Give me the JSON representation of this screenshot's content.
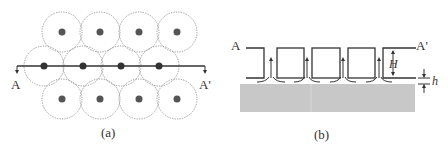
{
  "panel_a": {
    "caption": "(a)",
    "label_left": "A",
    "label_right": "A'",
    "circles": [
      {
        "cx": 62,
        "cy": 32
      },
      {
        "cx": 100,
        "cy": 32
      },
      {
        "cx": 139,
        "cy": 32
      },
      {
        "cx": 177,
        "cy": 32
      },
      {
        "cx": 44,
        "cy": 66
      },
      {
        "cx": 83,
        "cy": 66
      },
      {
        "cx": 121,
        "cy": 66
      },
      {
        "cx": 159,
        "cy": 66
      },
      {
        "cx": 62,
        "cy": 99
      },
      {
        "cx": 100,
        "cy": 99
      },
      {
        "cx": 139,
        "cy": 99
      },
      {
        "cx": 177,
        "cy": 99
      }
    ],
    "circle_radius": 20,
    "dot_radius": 3.5,
    "section_line": {
      "x1": 17,
      "x2": 205,
      "y": 66
    }
  },
  "panel_b": {
    "caption": "(b)",
    "label_left": "A",
    "label_right": "A'",
    "dimension_H": "H",
    "dimension_h": "h",
    "top_y": 48,
    "bottom_y": 78,
    "substrate": {
      "x": 240,
      "y": 84,
      "w": 175,
      "h": 28
    },
    "cells": [
      {
        "x1": 276,
        "x2": 302
      },
      {
        "x1": 311,
        "x2": 339
      },
      {
        "x1": 348,
        "x2": 374
      },
      {
        "x1": 383,
        "x2": 399
      }
    ],
    "arrows_x": [
      272,
      307,
      343,
      379
    ]
  },
  "colors": {
    "line": "#333333",
    "dot": "#555555",
    "dotted": "#8a8a8a",
    "substrate": "#c8c8c8"
  }
}
